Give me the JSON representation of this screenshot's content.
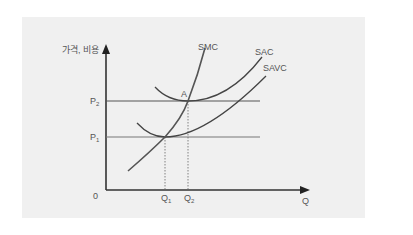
{
  "diagram": {
    "y_axis_label": "가격, 비용",
    "x_axis_label": "Q",
    "origin_label": "0",
    "price_levels": [
      {
        "id": "P2",
        "base": "P",
        "sub": "2"
      },
      {
        "id": "P1",
        "base": "P",
        "sub": "1"
      }
    ],
    "quantity_levels": [
      {
        "id": "Q1",
        "base": "Q",
        "sub": "1"
      },
      {
        "id": "Q2",
        "base": "Q",
        "sub": "2"
      }
    ],
    "curves": [
      {
        "id": "SMC",
        "label": "SMC",
        "description": "short-run marginal cost, upward sloping, crosses SAVC min at (Q1,P1) and SAC min at (Q2,P2)"
      },
      {
        "id": "SAC",
        "label": "SAC",
        "description": "short-run average cost, U-shaped, minimum at point A (Q2,P2)"
      },
      {
        "id": "SAVC",
        "label": "SAVC",
        "description": "short-run average variable cost, U-shaped, minimum at (Q1,P1)"
      }
    ],
    "points": [
      {
        "id": "A",
        "label": "A",
        "at": [
          "Q2",
          "P2"
        ]
      }
    ],
    "colors": {
      "panel_bg": "#f0f0f0",
      "axis": "#333333",
      "curve": "#4a4a4a",
      "label": "#555555"
    }
  }
}
